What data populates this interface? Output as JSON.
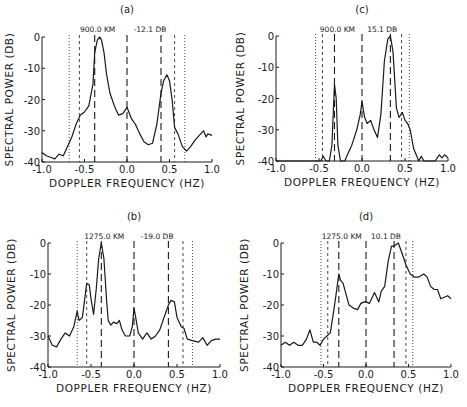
{
  "figure": {
    "colors": {
      "ink": "#1a1a1a",
      "background": "#ffffff"
    }
  },
  "chart_data": [
    {
      "id": "a",
      "type": "line",
      "title": "(a)",
      "xlabel": "DOPPLER FREQUENCY (HZ)",
      "ylabel": "SPECTRAL POWER (DB)",
      "xlim": [
        -1.0,
        1.0
      ],
      "ylim": [
        -40,
        0
      ],
      "xticks": [
        "-1.0",
        "-0.5",
        "0.0",
        "0.5",
        "1.0"
      ],
      "yticks": [
        "0",
        "-10",
        "-20",
        "-30",
        "-40"
      ],
      "annotations": [
        "900.0 KM",
        "-12.1 DB"
      ],
      "vlines": {
        "long_dash": [
          -0.38,
          0.0,
          0.4
        ],
        "short_dash": [
          -0.56,
          0.56
        ],
        "dotted": [
          -0.68,
          0.68
        ]
      },
      "x": [
        -1.0,
        -0.95,
        -0.9,
        -0.85,
        -0.8,
        -0.75,
        -0.7,
        -0.65,
        -0.6,
        -0.55,
        -0.5,
        -0.45,
        -0.4,
        -0.38,
        -0.35,
        -0.32,
        -0.3,
        -0.27,
        -0.24,
        -0.2,
        -0.15,
        -0.1,
        -0.05,
        0.0,
        0.05,
        0.1,
        0.15,
        0.2,
        0.25,
        0.3,
        0.35,
        0.4,
        0.43,
        0.47,
        0.5,
        0.53,
        0.56,
        0.6,
        0.65,
        0.7,
        0.75,
        0.8,
        0.85,
        0.9,
        0.93,
        0.95,
        1.0
      ],
      "values": [
        -37,
        -38,
        -38.5,
        -39,
        -37.5,
        -38,
        -35,
        -32,
        -28,
        -25,
        -24,
        -22,
        -15,
        -5,
        -1,
        0,
        -1,
        -5,
        -12,
        -18,
        -22,
        -25,
        -24.5,
        -22.5,
        -26,
        -28,
        -31,
        -33.5,
        -34.5,
        -34,
        -28,
        -18,
        -14,
        -12.1,
        -14,
        -20,
        -29,
        -31,
        -35,
        -36.5,
        -35,
        -33,
        -31.5,
        -30,
        -32,
        -31,
        -31.5
      ]
    },
    {
      "id": "b",
      "type": "line",
      "title": "(b)",
      "xlabel": "DOPPLER FREQUENCY (HZ)",
      "ylabel": "SPECTRAL POWER (DB)",
      "xlim": [
        -1.0,
        1.0
      ],
      "ylim": [
        -40,
        0
      ],
      "xticks": [
        "-1.0",
        "-0.5",
        "0.0",
        "0.5",
        "1.0"
      ],
      "yticks": [
        "0",
        "-10",
        "-20",
        "-30",
        "-40"
      ],
      "annotations": [
        "1275.0 KM",
        "-19.0 DB"
      ],
      "vlines": {
        "long_dash": [
          -0.38,
          0.0,
          0.4
        ],
        "short_dash": [
          -0.55,
          0.57
        ],
        "dotted": [
          -0.66,
          0.68
        ]
      },
      "x": [
        -1.0,
        -0.95,
        -0.9,
        -0.85,
        -0.8,
        -0.75,
        -0.7,
        -0.66,
        -0.64,
        -0.6,
        -0.55,
        -0.52,
        -0.5,
        -0.47,
        -0.44,
        -0.41,
        -0.38,
        -0.35,
        -0.32,
        -0.3,
        -0.27,
        -0.24,
        -0.2,
        -0.17,
        -0.14,
        -0.1,
        -0.05,
        -0.02,
        0.0,
        0.02,
        0.05,
        0.1,
        0.15,
        0.2,
        0.25,
        0.3,
        0.35,
        0.4,
        0.43,
        0.47,
        0.5,
        0.55,
        0.58,
        0.62,
        0.68,
        0.75,
        0.8,
        0.85,
        0.9,
        0.95,
        1.0
      ],
      "values": [
        -30,
        -33,
        -33.5,
        -31,
        -29,
        -30,
        -27,
        -22,
        -25,
        -24,
        -13,
        -13.5,
        -18,
        -23,
        -15,
        -5,
        0,
        -5,
        -18,
        -25,
        -26.5,
        -25.5,
        -26,
        -25,
        -28,
        -30,
        -30,
        -27,
        -21,
        -24,
        -29,
        -31,
        -29,
        -31,
        -30,
        -28,
        -24,
        -20,
        -18.5,
        -19,
        -24,
        -27,
        -27.5,
        -31,
        -31.5,
        -32,
        -30.5,
        -33,
        -31.5,
        -31,
        -31
      ]
    },
    {
      "id": "c",
      "type": "line",
      "title": "(c)",
      "xlabel": "DOPPLER FREQUENCY (HZ)",
      "ylabel": "SPECTRAL POWER (DB)",
      "xlim": [
        -1.0,
        1.0
      ],
      "ylim": [
        -40,
        0
      ],
      "xticks": [
        "-1.0",
        "-0.5",
        "0.0",
        "0.5",
        "1.0"
      ],
      "yticks": [
        "0",
        "-10",
        "-20",
        "-30",
        "-40"
      ],
      "annotations": [
        "900.0 KM",
        "15.1 DB"
      ],
      "vlines": {
        "long_dash": [
          -0.32,
          0.0,
          0.33
        ],
        "short_dash": [
          -0.46,
          0.46
        ],
        "dotted": [
          -0.54,
          0.55
        ]
      },
      "x": [
        -1.0,
        -0.6,
        -0.48,
        -0.45,
        -0.42,
        -0.38,
        -0.35,
        -0.32,
        -0.3,
        -0.28,
        -0.25,
        -0.22,
        -0.2,
        -0.17,
        -0.12,
        -0.06,
        -0.02,
        0.0,
        0.03,
        0.06,
        0.1,
        0.14,
        0.18,
        0.22,
        0.26,
        0.3,
        0.33,
        0.36,
        0.4,
        0.43,
        0.47,
        0.5,
        0.53,
        0.56,
        0.6,
        0.63,
        0.66,
        0.69,
        0.72,
        0.75,
        0.85,
        0.9,
        0.93,
        0.96,
        1.0
      ],
      "values": [
        -40,
        -40,
        -40,
        -38.5,
        -40,
        -40,
        -35,
        -15.5,
        -20,
        -35,
        -40,
        -40,
        -40,
        -38,
        -35,
        -30,
        -25,
        -21,
        -26,
        -28,
        -27,
        -30,
        -32.5,
        -25,
        -8,
        -1,
        0,
        -5,
        -23,
        -26,
        -24.5,
        -27,
        -28,
        -30,
        -36,
        -38,
        -40,
        -38.5,
        -40,
        -40,
        -40,
        -38,
        -39,
        -38,
        -39
      ]
    },
    {
      "id": "d",
      "type": "line",
      "title": "(d)",
      "xlabel": "DOPPLER FREQUENCY (HZ)",
      "ylabel": "SPECTRAL POWER (DB)",
      "xlim": [
        -1.0,
        1.0
      ],
      "ylim": [
        -40,
        0
      ],
      "xticks": [
        "-1.0",
        "-0.5",
        "0.0",
        "0.5",
        "1.0"
      ],
      "yticks": [
        "0",
        "-10",
        "-20",
        "-30",
        "-40"
      ],
      "annotations": [
        "1275.0 KM",
        "10.1 DB"
      ],
      "vlines": {
        "long_dash": [
          -0.32,
          0.0,
          0.33
        ],
        "short_dash": [
          -0.45,
          0.47
        ],
        "dotted": [
          -0.53,
          0.55
        ]
      },
      "x": [
        -1.0,
        -0.95,
        -0.9,
        -0.85,
        -0.8,
        -0.75,
        -0.7,
        -0.66,
        -0.62,
        -0.58,
        -0.54,
        -0.5,
        -0.46,
        -0.42,
        -0.38,
        -0.35,
        -0.32,
        -0.3,
        -0.27,
        -0.24,
        -0.2,
        -0.15,
        -0.1,
        -0.06,
        -0.02,
        0.0,
        0.04,
        0.1,
        0.15,
        0.18,
        0.22,
        0.26,
        0.3,
        0.33,
        0.38,
        0.42,
        0.47,
        0.52,
        0.57,
        0.62,
        0.68,
        0.72,
        0.76,
        0.8,
        0.84,
        0.88,
        0.92,
        0.96,
        1.0
      ],
      "values": [
        -33,
        -32,
        -33,
        -32,
        -33,
        -33,
        -31,
        -28,
        -32,
        -32,
        -33,
        -31,
        -30,
        -29,
        -22,
        -16,
        -10,
        -12,
        -13,
        -16,
        -20,
        -21,
        -21.5,
        -19.5,
        -19,
        -19,
        -19.5,
        -16,
        -19,
        -15.5,
        -14,
        -6,
        -1,
        -1,
        0,
        -3,
        -7,
        -10,
        -11,
        -11,
        -10,
        -11,
        -14,
        -15,
        -15,
        -18,
        -17.5,
        -17,
        -18
      ]
    }
  ]
}
